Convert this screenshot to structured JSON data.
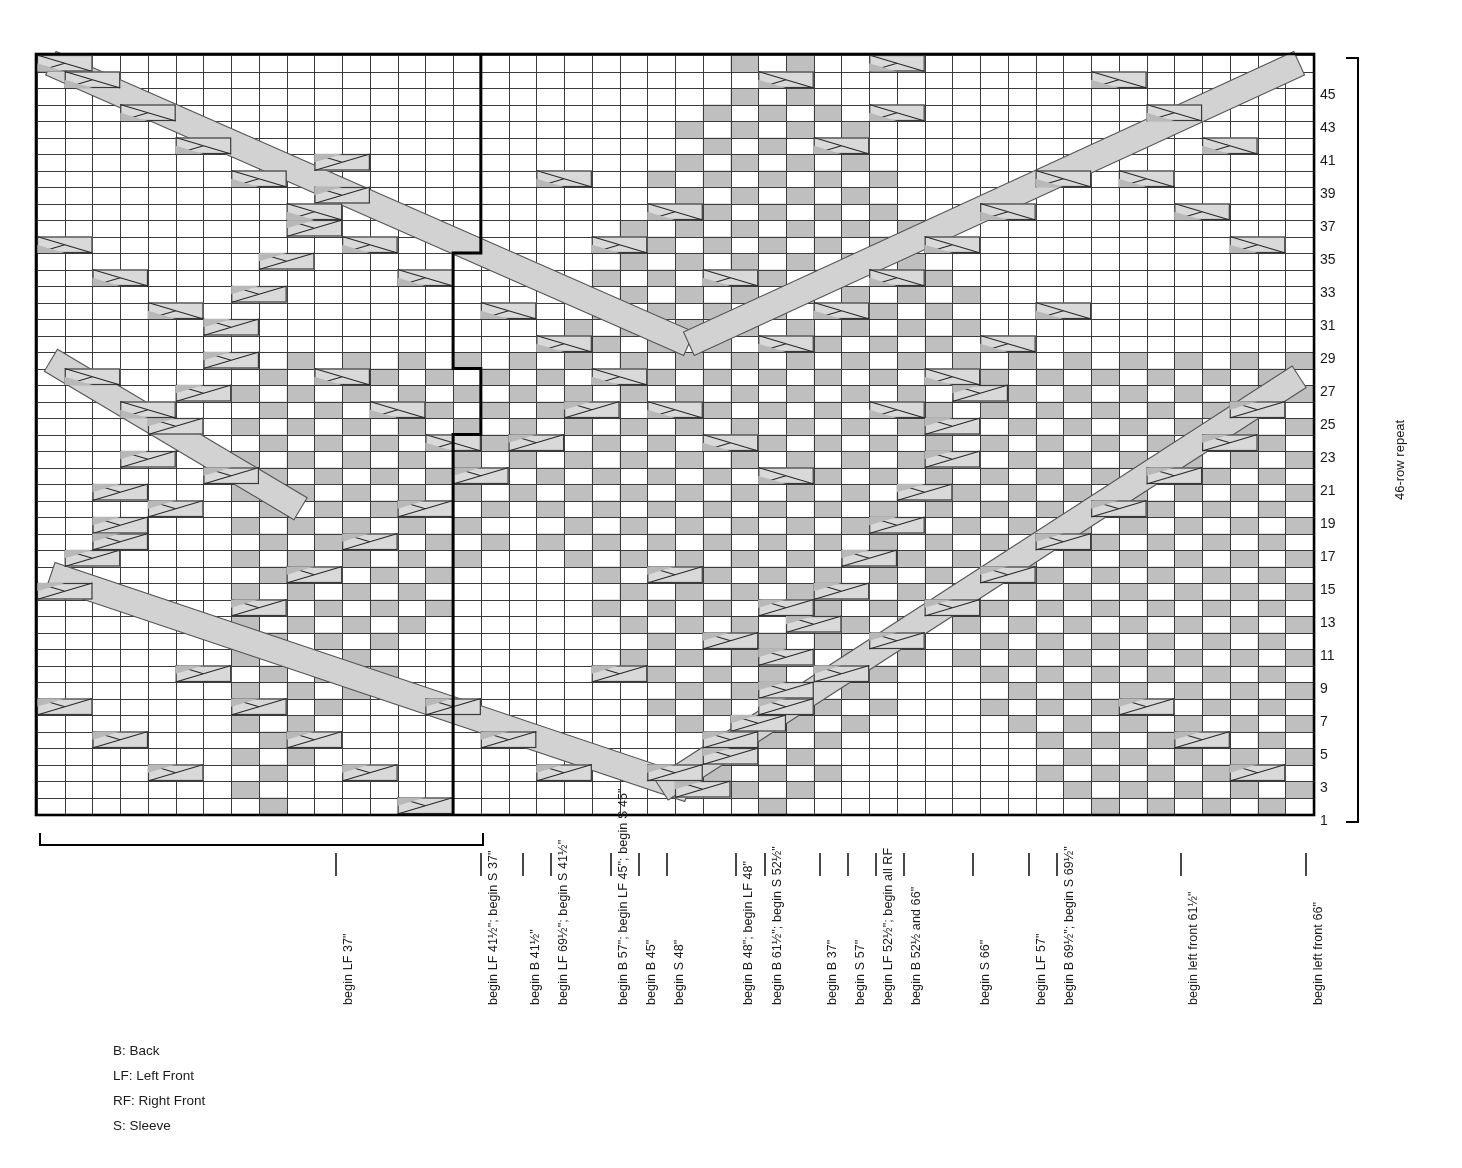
{
  "chart_data": {
    "type": "table",
    "grid": {
      "columns": 46,
      "rows": 46,
      "cell_width": 27.74,
      "cell_height": 16.5,
      "origin_x": 37,
      "origin_y": 55
    },
    "row_numbers": [
      1,
      3,
      5,
      7,
      9,
      11,
      13,
      15,
      17,
      19,
      21,
      23,
      25,
      27,
      29,
      31,
      33,
      35,
      37,
      39,
      41,
      43,
      45
    ],
    "row_number_first_y": 812,
    "row_number_step": 33.0,
    "colors": {
      "grid_line": "#3b3b3b",
      "minor_line": "#8a8a8a",
      "cell_shaded": "#bfbfbf",
      "cable_fill": "#d9d9d9",
      "cable_fill_dark": "#b8b8b8",
      "travel_line": "#d2d2d2",
      "border": "#000000",
      "background": "#ffffff"
    },
    "legend_note": "Shaded squares = purl/background texture; two-cell boxes with X = cable crossings; long pale diagonals = traveling cable ropes.",
    "shaded_cells": [
      [
        0,
        14
      ],
      [
        0,
        15
      ],
      [
        0,
        16
      ],
      [
        0,
        17
      ],
      [
        0,
        18
      ],
      [
        0,
        19
      ],
      [
        0,
        20
      ],
      [
        0,
        21
      ],
      [
        0,
        22
      ],
      [
        0,
        23
      ],
      [
        0,
        24
      ],
      [
        0,
        25
      ],
      [
        1,
        13
      ],
      [
        1,
        14
      ],
      [
        1,
        15
      ],
      [
        1,
        16
      ],
      [
        1,
        17
      ],
      [
        1,
        18
      ],
      [
        1,
        19
      ],
      [
        1,
        20
      ],
      [
        1,
        21
      ],
      [
        1,
        22
      ],
      [
        1,
        23
      ],
      [
        1,
        24
      ],
      [
        1,
        26
      ]
    ]
  },
  "header": {
    "repeat_bracket_label": "46-row repeat"
  },
  "legend": {
    "items": [
      "B: Back",
      "LF: Left Front",
      "RF: Right Front",
      "S: Sleeve"
    ]
  },
  "column_labels": [
    {
      "x": 336,
      "text": "begin LF 37\""
    },
    {
      "x": 481,
      "text": "begin LF 41½\"; begin S 37\""
    },
    {
      "x": 523,
      "text": "begin B 41½\""
    },
    {
      "x": 551,
      "text": "begin LF 69½\"; begin S 41½\""
    },
    {
      "x": 611,
      "text": "begin B 57\"; begin LF 45\"; begin S 45\""
    },
    {
      "x": 639,
      "text": "begin B 45\""
    },
    {
      "x": 667,
      "text": "begin S 48\""
    },
    {
      "x": 736,
      "text": "begin B 48\"; begin LF 48\""
    },
    {
      "x": 765,
      "text": "begin B 61½\"; begin S 52½\""
    },
    {
      "x": 820,
      "text": "begin B 37\""
    },
    {
      "x": 848,
      "text": "begin S 57\""
    },
    {
      "x": 876,
      "text": "begin  LF 52½\"; begin all RF"
    },
    {
      "x": 904,
      "text": "begin B 52½ and 66\""
    },
    {
      "x": 973,
      "text": "begin S 66\""
    },
    {
      "x": 1029,
      "text": "begin LF 57\""
    },
    {
      "x": 1057,
      "text": "begin B 69½\"; begin S 69½\""
    },
    {
      "x": 1181,
      "text": "begin left front 61½\""
    },
    {
      "x": 1306,
      "text": "begin left front 66\""
    }
  ],
  "brackets": {
    "bottom_left": {
      "x1": 40,
      "x2": 483,
      "y": 845,
      "tick": 12
    },
    "right_repeat": {
      "x": 1358,
      "y1": 58,
      "y2": 822,
      "tick": 12
    }
  }
}
